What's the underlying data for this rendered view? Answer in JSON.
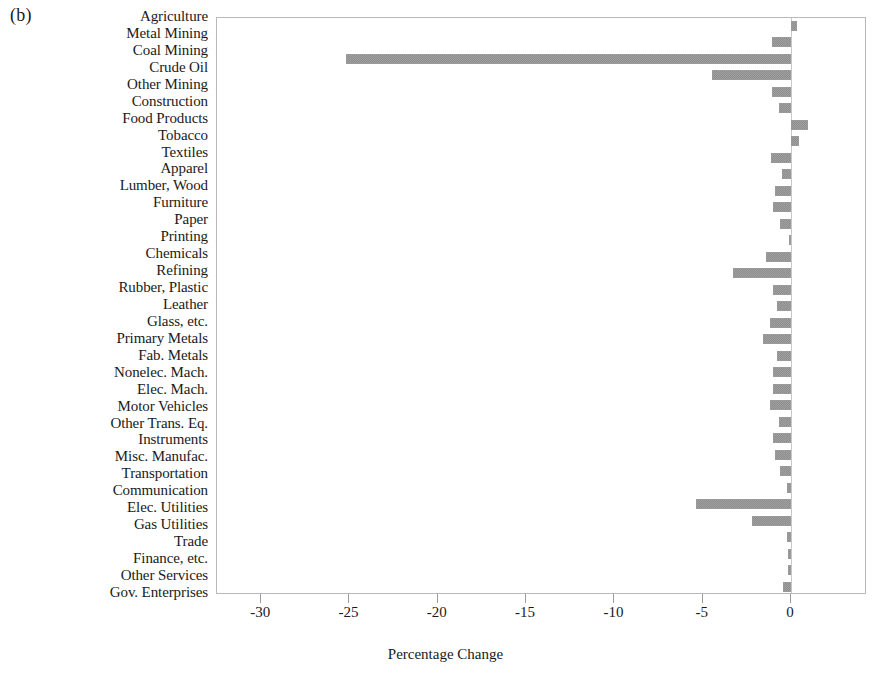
{
  "figure": {
    "panel_label": "(b)"
  },
  "chart_data": {
    "type": "bar",
    "orientation": "horizontal",
    "title": "",
    "xlabel": "Percentage Change",
    "ylabel": "",
    "xlim": [
      -32.5,
      4.3
    ],
    "xticks": [
      -30,
      -25,
      -20,
      -15,
      -10,
      -5,
      0
    ],
    "xticklabels": [
      "-30",
      "-25",
      "-20",
      "-15",
      "-10",
      "-5",
      "0"
    ],
    "grid": false,
    "legend": null,
    "bar_color": "#a0a0a0",
    "categories": [
      "Agriculture",
      "Metal Mining",
      "Coal Mining",
      "Crude Oil",
      "Other Mining",
      "Construction",
      "Food Products",
      "Tobacco",
      "Textiles",
      "Apparel",
      "Lumber, Wood",
      "Furniture",
      "Paper",
      "Printing",
      "Chemicals",
      "Refining",
      "Rubber, Plastic",
      "Leather",
      "Glass, etc.",
      "Primary Metals",
      "Fab. Metals",
      "Nonelec. Mach.",
      "Elec. Mach.",
      "Motor Vehicles",
      "Other Trans. Eq.",
      "Instruments",
      "Misc. Manufac.",
      "Transportation",
      "Communication",
      "Elec. Utilities",
      "Gas Utilities",
      "Trade",
      "Finance, etc.",
      "Other Services",
      "Gov. Enterprises"
    ],
    "values": [
      0.35,
      -1.1,
      -25.2,
      -4.5,
      -1.1,
      -0.7,
      0.95,
      0.45,
      -1.15,
      -0.5,
      -0.9,
      -1.0,
      -0.6,
      -0.1,
      -1.4,
      -3.3,
      -1.0,
      -0.8,
      -1.2,
      -1.6,
      -0.8,
      -1.0,
      -1.0,
      -1.2,
      -0.7,
      -1.0,
      -0.9,
      -0.6,
      -0.25,
      -5.4,
      -2.2,
      -0.25,
      -0.2,
      -0.15,
      -0.45
    ]
  }
}
